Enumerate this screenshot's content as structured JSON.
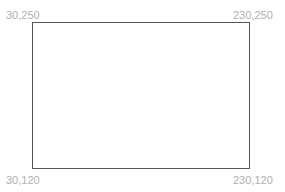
{
  "canvas": {
    "corners": {
      "top_left": "30,250",
      "top_right": "230,250",
      "bottom_left": "30,120",
      "bottom_right": "230,120"
    },
    "rect_color": "#555555",
    "label_color": "#b0b0b0"
  }
}
